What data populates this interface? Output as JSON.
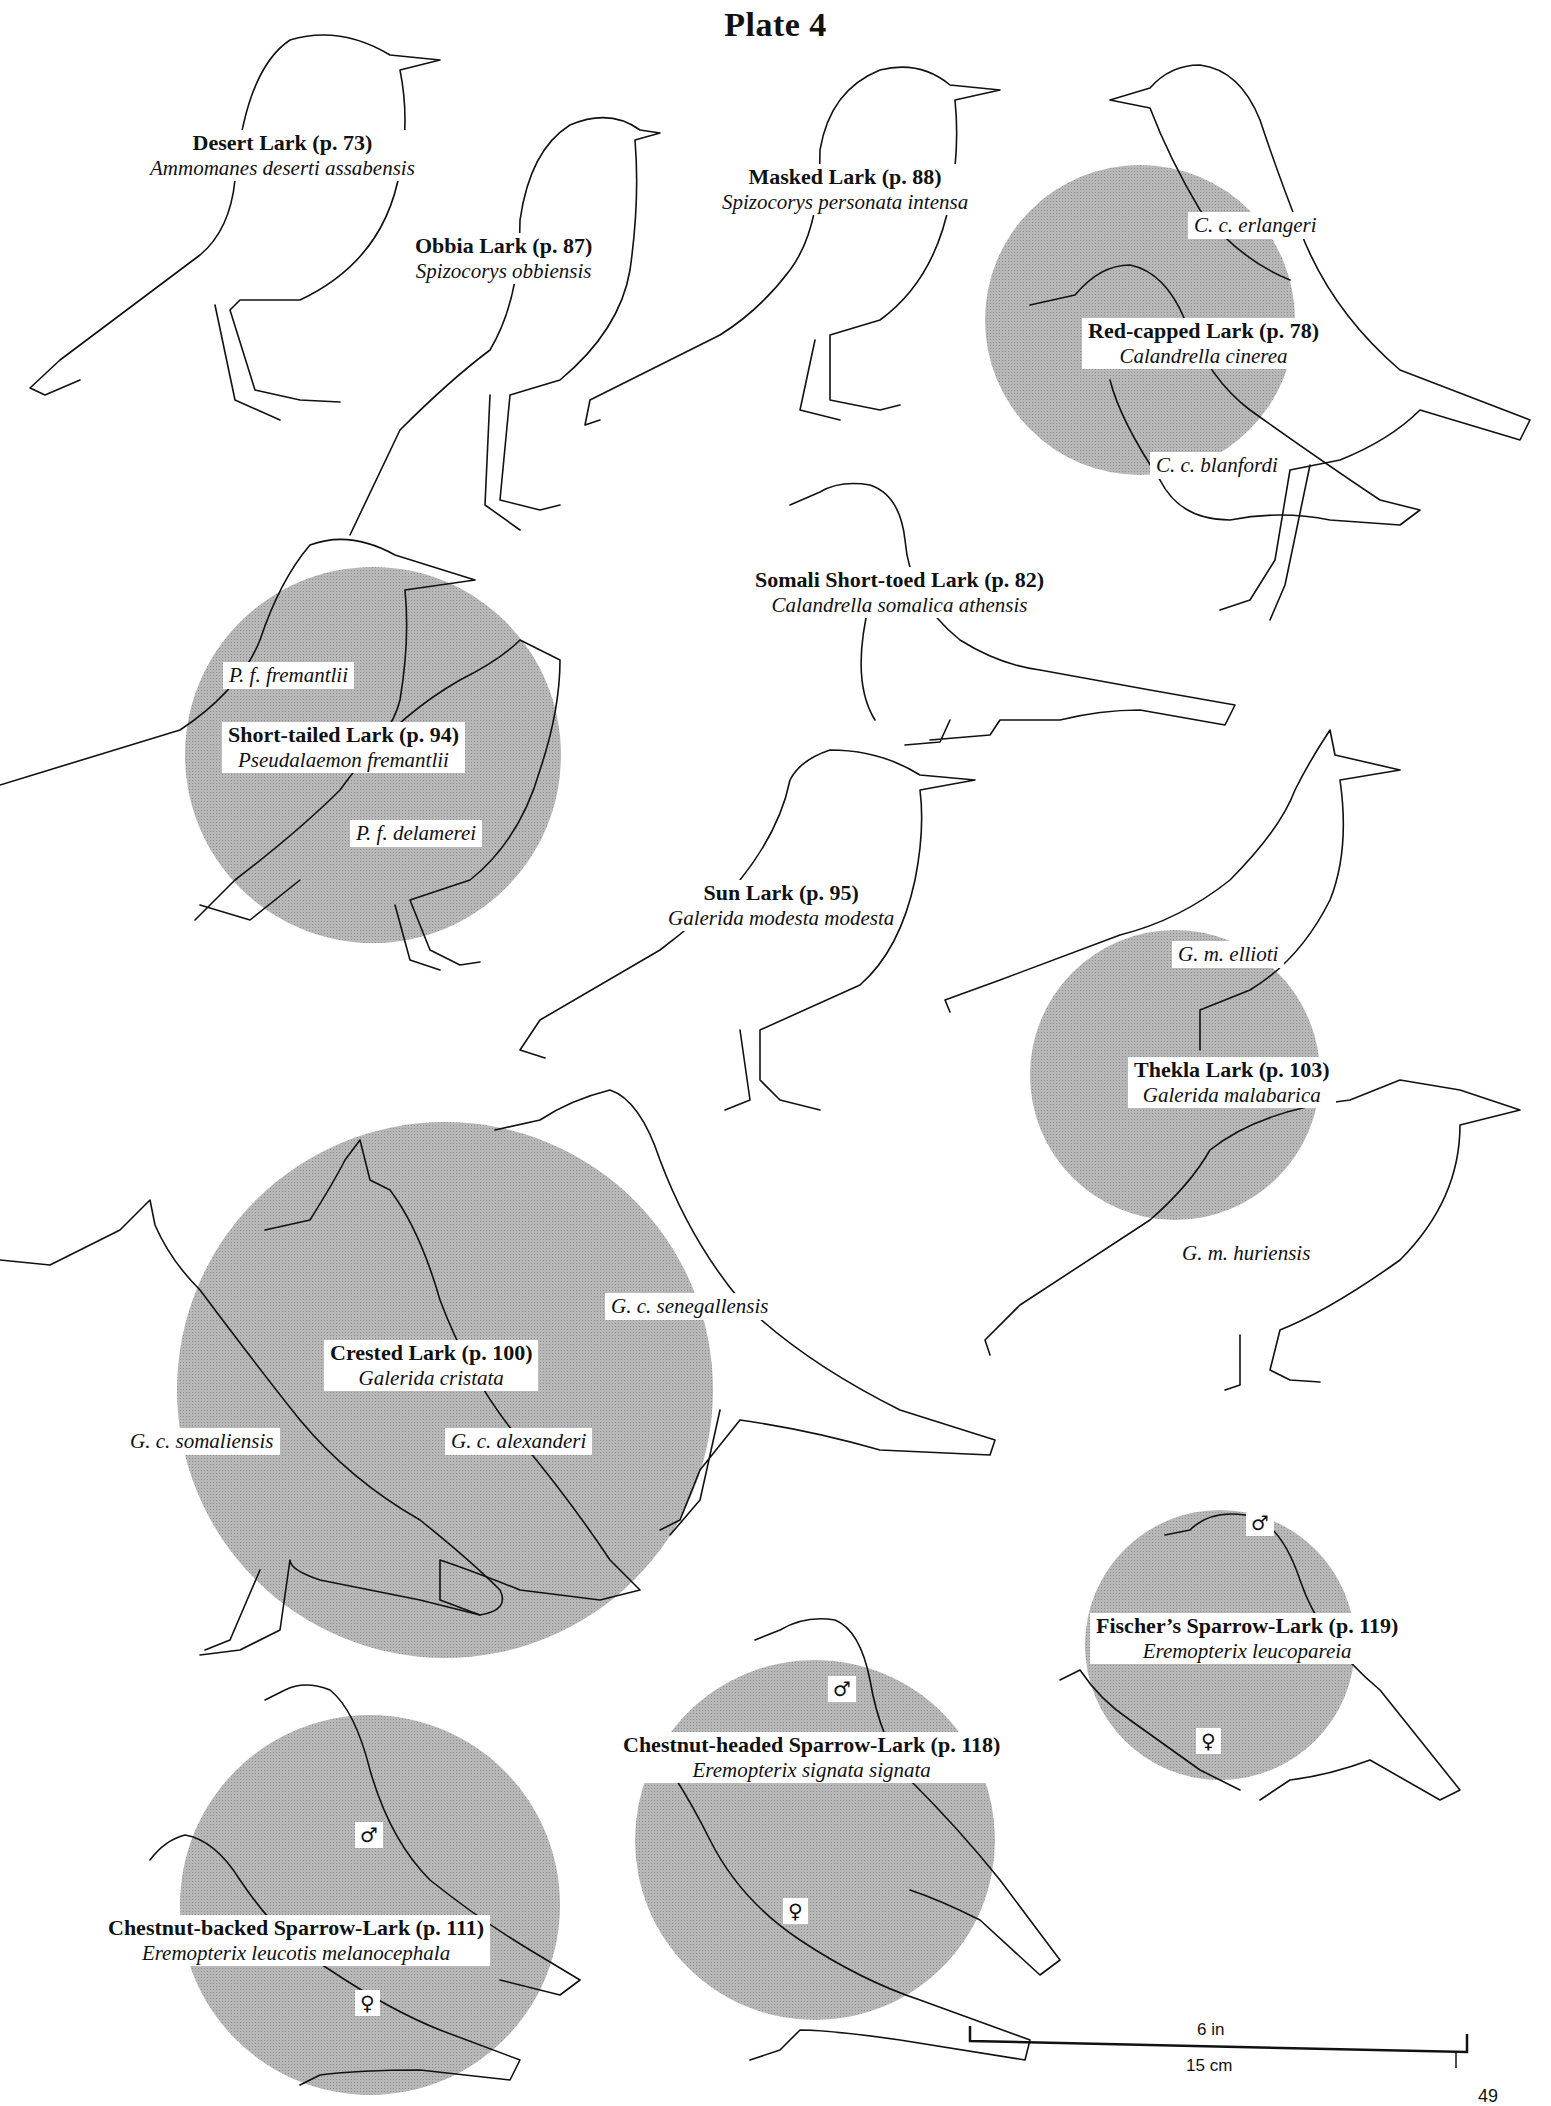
{
  "plate": {
    "title": "Plate 4"
  },
  "species": [
    {
      "id": "desert-lark",
      "common": "Desert Lark (p. 73)",
      "scientific": "Ammomanes deserti assabensis"
    },
    {
      "id": "obbia-lark",
      "common": "Obbia Lark (p. 87)",
      "scientific": "Spizocorys obbiensis"
    },
    {
      "id": "masked-lark",
      "common": "Masked Lark (p. 88)",
      "scientific": "Spizocorys personata intensa"
    },
    {
      "id": "red-capped-lark",
      "common": "Red-capped Lark (p. 78)",
      "scientific": "Calandrella cinerea",
      "subspecies": [
        "C. c. erlangeri",
        "C. c. blanfordi"
      ]
    },
    {
      "id": "somali-short-toed-lark",
      "common": "Somali Short-toed Lark (p. 82)",
      "scientific": "Calandrella somalica athensis"
    },
    {
      "id": "short-tailed-lark",
      "common": "Short-tailed Lark (p. 94)",
      "scientific": "Pseudalaemon fremantlii",
      "subspecies": [
        "P. f. fremantlii",
        "P. f. delamerei"
      ]
    },
    {
      "id": "sun-lark",
      "common": "Sun Lark (p. 95)",
      "scientific": "Galerida modesta modesta"
    },
    {
      "id": "thekla-lark",
      "common": "Thekla Lark (p. 103)",
      "scientific": "Galerida malabarica",
      "subspecies": [
        "G. m. ellioti",
        "G. m. huriensis"
      ]
    },
    {
      "id": "crested-lark",
      "common": "Crested Lark (p. 100)",
      "scientific": "Galerida cristata",
      "subspecies": [
        "G. c. senegallensis",
        "G. c. somaliensis",
        "G. c. alexanderi"
      ]
    },
    {
      "id": "fischers-sparrow-lark",
      "common": "Fischer’s Sparrow-Lark (p. 119)",
      "scientific": "Eremopterix leucopareia",
      "sexes": [
        "♂",
        "♀"
      ]
    },
    {
      "id": "chestnut-headed-sparrow-lark",
      "common": "Chestnut-headed Sparrow-Lark (p. 118)",
      "scientific": "Eremopterix signata signata",
      "sexes": [
        "♂",
        "♀"
      ]
    },
    {
      "id": "chestnut-backed-sparrow-lark",
      "common": "Chestnut-backed Sparrow-Lark (p. 111)",
      "scientific": "Eremopterix leucotis melanocephala",
      "sexes": [
        "♂",
        "♀"
      ]
    }
  ],
  "scale_bar": {
    "imperial": "6 in",
    "metric": "15 cm"
  },
  "page_number": "49"
}
